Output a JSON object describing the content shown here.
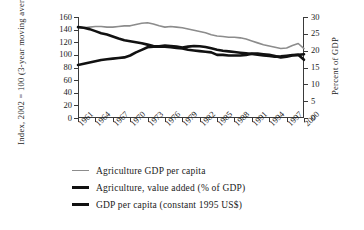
{
  "chart_data": {
    "type": "line",
    "title": "",
    "xlabel": "",
    "ylabel": "Index, 2002 = 100 (3-year moving average)",
    "y2label": "Percent of GDP",
    "grid": false,
    "legend_position": "bottom-left",
    "xlim": [
      1961,
      2000
    ],
    "ylim": [
      0,
      160
    ],
    "y2lim": [
      0,
      30
    ],
    "yticks": [
      0,
      20,
      40,
      60,
      80,
      100,
      120,
      140,
      160
    ],
    "y2ticks": [
      0,
      5,
      10,
      15,
      20,
      25,
      30
    ],
    "xticks": [
      1961,
      1964,
      1967,
      1970,
      1973,
      1976,
      1979,
      1982,
      1985,
      1988,
      1991,
      1994,
      1997,
      2000
    ],
    "xticklabels": [
      "1961",
      "1964",
      "1967",
      "1970",
      "1973",
      "1976",
      "1979",
      "1982",
      "1985",
      "1988",
      "1991",
      "1994",
      "1997",
      "2000"
    ],
    "x": [
      1961,
      1962,
      1963,
      1964,
      1965,
      1966,
      1967,
      1968,
      1969,
      1970,
      1971,
      1972,
      1973,
      1974,
      1975,
      1976,
      1977,
      1978,
      1979,
      1980,
      1981,
      1982,
      1983,
      1984,
      1985,
      1986,
      1987,
      1988,
      1989,
      1990,
      1991,
      1992,
      1993,
      1994,
      1995,
      1996,
      1997,
      1998,
      1999,
      2000
    ],
    "series": [
      {
        "name": "Agriculture GDP per capita",
        "axis": "left",
        "color": "#8c8c8c",
        "width": 1.6,
        "values": [
          144,
          143,
          144,
          145,
          145,
          144,
          144,
          145,
          146,
          146,
          148,
          150,
          151,
          149,
          146,
          144,
          145,
          144,
          143,
          141,
          139,
          137,
          135,
          132,
          130,
          129,
          128,
          128,
          127,
          125,
          122,
          119,
          116,
          114,
          112,
          110,
          111,
          115,
          118,
          110
        ]
      },
      {
        "name": "Agriculture, value added (% of GDP)",
        "axis": "right",
        "color": "#111111",
        "width": 2.6,
        "values": [
          27.0,
          26.8,
          26.4,
          25.8,
          25.2,
          24.8,
          24.2,
          23.6,
          23.1,
          22.8,
          22.5,
          22.2,
          21.8,
          21.4,
          21.3,
          21.5,
          21.4,
          21.2,
          20.9,
          21.2,
          21.4,
          21.3,
          21.1,
          20.7,
          20.3,
          20.0,
          19.8,
          19.6,
          19.4,
          19.2,
          19.0,
          18.8,
          18.6,
          18.4,
          18.2,
          18.3,
          18.5,
          18.7,
          18.8,
          17.3
        ]
      },
      {
        "name": "GDP per capita (constant 1995 US$)",
        "axis": "left",
        "color": "#111111",
        "width": 2.6,
        "values": [
          84,
          86,
          88,
          90,
          92,
          93,
          94,
          95,
          96,
          99,
          104,
          108,
          112,
          113,
          113,
          113,
          112,
          111,
          110,
          108,
          107,
          106,
          105,
          104,
          100,
          100,
          99,
          99,
          99,
          100,
          102,
          102,
          101,
          100,
          98,
          96,
          97,
          99,
          100,
          101
        ]
      }
    ]
  },
  "legend": {
    "items": [
      {
        "label": "Agriculture GDP per capita",
        "color": "#8c8c8c",
        "thickness": "1.6px"
      },
      {
        "label": "Agriculture, value added (% of GDP)",
        "color": "#111111",
        "thickness": "3px"
      },
      {
        "label": "GDP per capita (constant 1995 US$)",
        "color": "#111111",
        "thickness": "2.6px"
      }
    ]
  }
}
